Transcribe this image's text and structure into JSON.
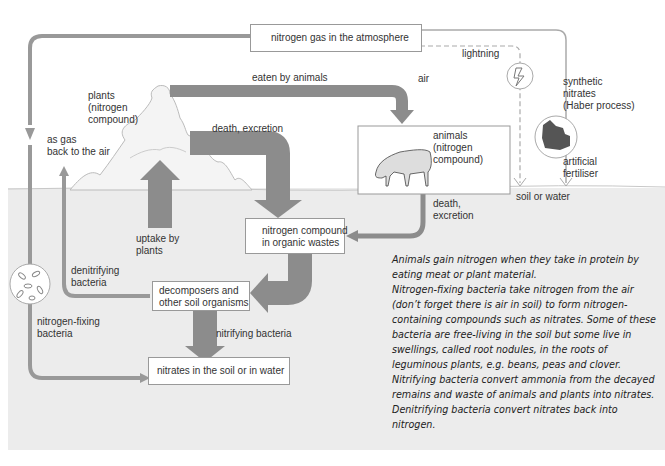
{
  "diagram": {
    "boxes": {
      "atmosphere": "nitrogen gas in the atmosphere",
      "organic_wastes": "nitrogen compound\nin organic wastes",
      "decomposers": "decomposers and\nother soil organisms",
      "nitrates": "nitrates in the soil or in water"
    },
    "labels": {
      "plants": "plants\n(nitrogen\ncompound)",
      "animals": "animals\n(nitrogen\ncompound)",
      "eaten_by_animals": "eaten by animals",
      "air": "air",
      "lightning": "lightning",
      "synthetic_nitrates": "synthetic\nnitrates\n(Haber process)",
      "artificial_fertiliser": "artificial\nfertiliser",
      "soil_or_water": "soil or water",
      "death_excretion_plants": "death, excretion",
      "death_excretion_animals": "death,\nexcretion",
      "as_gas": "as gas\nback to the air",
      "uptake_by_plants": "uptake by\nplants",
      "denitrifying_bacteria": "denitrifying\nbacteria",
      "nitrogen_fixing_bacteria": "nitrogen-fixing\nbacteria",
      "nitrifying_bacteria": "nitrifying bacteria"
    },
    "icons": [
      "lightning-icon",
      "factory-icon",
      "bacteria-icon",
      "cow-icon",
      "plant-cloud-icon"
    ],
    "colors": {
      "arrow": "#8c8c8c",
      "soil": "#ececec",
      "box_border": "#999999",
      "text": "#333333"
    }
  },
  "notes": [
    "Animals gain nitrogen when they take in protein by eating meat or plant material.",
    "Nitrogen-fixing bacteria take nitrogen from the air (don’t forget there is air in soil) to form nitrogen-containing compounds such as nitrates. Some of these bacteria are free-living in the soil but some live in swellings, called root nodules, in the roots of leguminous plants, e.g. beans, peas and clover.",
    "Nitrifying bacteria convert ammonia from the decayed remains and waste of animals and plants into nitrates.",
    "Denitrifying bacteria convert nitrates back into nitrogen."
  ]
}
